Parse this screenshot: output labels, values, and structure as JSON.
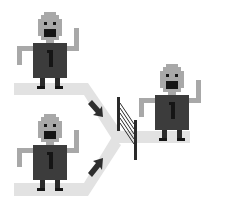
{
  "diagram": {
    "colors": {
      "background": "#ffffff",
      "path": "#e2e2e2",
      "robot_skin": "#a8a8a8",
      "robot_body": "#3c3c3c",
      "robot_dark": "#151515",
      "arrow": "#2e2e2e",
      "gate": "#2a2a2a"
    },
    "robots": [
      {
        "id": "top-robot",
        "label": "1"
      },
      {
        "id": "bottom-robot",
        "label": "1"
      },
      {
        "id": "right-robot",
        "label": "1"
      }
    ],
    "icons": [
      "robot-icon",
      "arrow-icon",
      "gate-icon",
      "path-icon"
    ]
  }
}
